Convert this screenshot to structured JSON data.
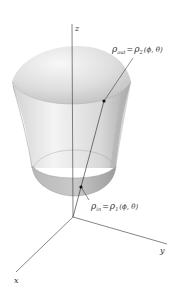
{
  "diagram": {
    "type": "3d-region-spherical-coordinates",
    "axes": {
      "z": {
        "label": "z"
      },
      "x": {
        "label": "x"
      },
      "y": {
        "label": "y"
      }
    },
    "labels": {
      "outer": {
        "rho": "ρ",
        "rho_sub": "out",
        "eq": "=",
        "rhs_rho": "ρ",
        "rhs_sub": "2",
        "args": "(ϕ, θ)"
      },
      "inner": {
        "rho": "ρ",
        "rho_sub": "in",
        "eq": "=",
        "rhs_rho": "ρ",
        "rhs_sub": "1",
        "args": "(ϕ, θ)"
      }
    },
    "colors": {
      "solid_light": "#f2f2f2",
      "solid_mid": "#d6d6d6",
      "solid_dark": "#a8a8a8",
      "axis": "#333333",
      "point": "#111111"
    }
  }
}
